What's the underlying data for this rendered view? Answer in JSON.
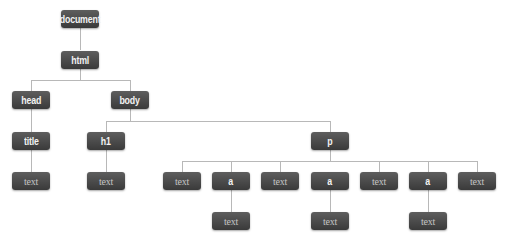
{
  "diagram": {
    "title": "",
    "nodes": {
      "document": "document",
      "html": "html",
      "head": "head",
      "body": "body",
      "title": "title",
      "title_text": "text",
      "h1": "h1",
      "h1_text": "text",
      "p": "p",
      "p_children": [
        {
          "label": "text",
          "type": "text"
        },
        {
          "label": "a",
          "type": "element",
          "child": "text"
        },
        {
          "label": "text",
          "type": "text"
        },
        {
          "label": "a",
          "type": "element",
          "child": "text"
        },
        {
          "label": "text",
          "type": "text"
        },
        {
          "label": "a",
          "type": "element",
          "child": "text"
        },
        {
          "label": "text",
          "type": "text"
        }
      ]
    },
    "colors": {
      "node_fill": "#4a4a4a",
      "node_label": "#f2f2f2",
      "text_node_label": "#c4c4c4",
      "connector": "#b8b8b8",
      "background": "#ffffff"
    }
  }
}
